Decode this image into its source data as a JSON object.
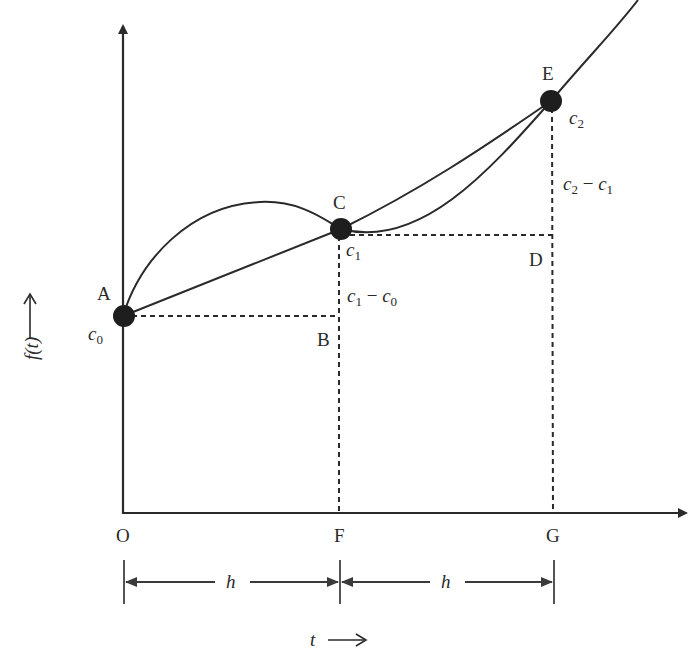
{
  "diagram": {
    "type": "numerical-integration-geometry",
    "colors": {
      "ink": "#2a2a2a",
      "background": "#ffffff"
    },
    "axes": {
      "x_label_var": "t",
      "x_label_arrow": "⟶",
      "y_label": "f(t)",
      "y_label_arrow": "⟶"
    },
    "points": {
      "A": "A",
      "B": "B",
      "C": "C",
      "D": "D",
      "E": "E",
      "O": "O",
      "F": "F",
      "G": "G"
    },
    "values": {
      "c0_base": "c",
      "c0_sub": "0",
      "c1_base": "c",
      "c1_sub": "1",
      "c2_base": "c",
      "c2_sub": "2"
    },
    "differences": {
      "c1_minus_c0": {
        "a": "c",
        "a_sub": "1",
        "op": " − ",
        "b": "c",
        "b_sub": "0"
      },
      "c2_minus_c1": {
        "a": "c",
        "a_sub": "2",
        "op": " − ",
        "b": "c",
        "b_sub": "1"
      }
    },
    "intervals": [
      {
        "label": "h"
      },
      {
        "label": "h"
      }
    ]
  }
}
